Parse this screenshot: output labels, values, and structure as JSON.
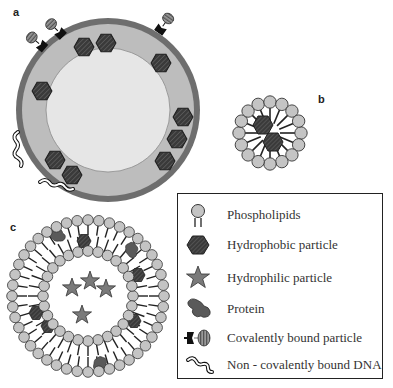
{
  "panels": {
    "a": {
      "label": "a",
      "description": "Liposome with hydrophobic particles in bilayer, covalently bound particles and non-covalently bound DNA on surface"
    },
    "b": {
      "label": "b",
      "description": "Micelle of phospholipids around hydrophobic particles"
    },
    "c": {
      "label": "c",
      "description": "Bilayer vesicle with hydrophobic particles and proteins in membrane, hydrophilic particles in core"
    }
  },
  "legend": {
    "items": [
      {
        "icon": "phospholipid-icon",
        "label": "Phospholipids"
      },
      {
        "icon": "hexagon-icon",
        "label": "Hydrophobic particle"
      },
      {
        "icon": "star-icon",
        "label": "Hydrophilic particle"
      },
      {
        "icon": "protein-icon",
        "label": "Protein"
      },
      {
        "icon": "covalent-particle-icon",
        "label": "Covalently bound particle"
      },
      {
        "icon": "dna-icon",
        "label": "Non - covalently bound DNA"
      }
    ]
  },
  "colors": {
    "outer_ring": "#6e6e6e",
    "membrane": "#bdbdbd",
    "core": "#e6e6e6",
    "hexagon": "#3c3c3c",
    "head": "#c4c4c4",
    "star": "#7a7a7a",
    "line": "#222222"
  }
}
